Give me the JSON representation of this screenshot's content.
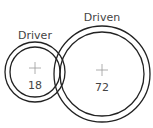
{
  "diagram": {
    "type": "gear-train",
    "line_color": "#222222",
    "cross_color": "#999999",
    "text_color": "#444444",
    "gears": [
      {
        "name": "driver",
        "label": "Driver",
        "teeth": "18",
        "cx": 35,
        "cy": 72,
        "r_outer": 30,
        "r_inner": 25
      },
      {
        "name": "driven",
        "label": "Driven",
        "teeth": "72",
        "cx": 102,
        "cy": 74,
        "r_outer": 48,
        "r_inner": 42
      }
    ]
  }
}
